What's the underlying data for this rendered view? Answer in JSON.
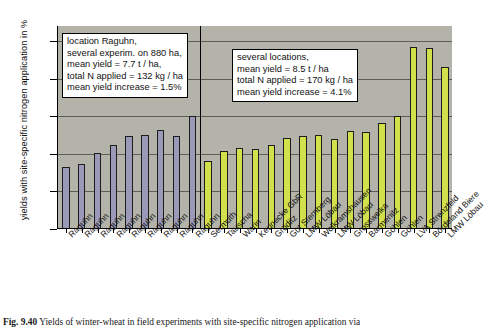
{
  "figure": {
    "caption_prefix": "Fig. 9.40",
    "caption_text": "Yields of winter-wheat in field experiments with site-specific nitrogen application via"
  },
  "annotations": {
    "box_left": [
      "location Raguhn,",
      "several experim. on 880 ha,",
      "mean yield = 7.7 t / ha,",
      "total N applied = 132 kg / ha",
      "mean yield increase = 1.5%"
    ],
    "box_right": [
      "several locations,",
      "mean yield = 8.5 t / ha",
      "total N applied = 170 kg / ha",
      "mean yield increase = 4.1%"
    ]
  },
  "colors": {
    "plot_background": "#b3b3aa",
    "series_raguhn": "#9a9ab8",
    "series_locations": "#d2e04b",
    "gridline": "#5e5e58",
    "axis": "#000000"
  },
  "chart_data": {
    "type": "bar",
    "title": "",
    "xlabel": "",
    "ylabel": "yields with site-specific nitrogen application in %",
    "ylim": [
      90,
      117
    ],
    "yticks": [
      90,
      95,
      100,
      105,
      110,
      115
    ],
    "grid": true,
    "legend": "none",
    "categories": [
      "Raguhn",
      "Raguhn",
      "Raguhn",
      "Raguhn",
      "Raguhn",
      "Raguhn",
      "Raguhn",
      "Raguhn",
      "Raguhn",
      "Sermuth",
      "Tauscha",
      "Warin",
      "Keunecke GbR",
      "Gröditz",
      "Gut Sternberg",
      "LMW Löbau",
      "Wolkramshausen",
      "LMW Löbau",
      "Grosswelka",
      "Barmenitz",
      "Göhlen",
      "Göhlen",
      "LVA Strenzfeld",
      "Bördeland Biere",
      "LMW Löbau"
    ],
    "values": [
      98.2,
      98.7,
      100.1,
      101.2,
      102.4,
      102.5,
      103.2,
      102.4,
      105.0,
      99.0,
      100.4,
      100.8,
      100.7,
      101.2,
      102.1,
      102.4,
      102.5,
      102.0,
      103.1,
      102.9,
      104.1,
      105.0,
      114.2,
      114.1,
      111.6
    ],
    "group_of_bar": [
      "raguhn",
      "raguhn",
      "raguhn",
      "raguhn",
      "raguhn",
      "raguhn",
      "raguhn",
      "raguhn",
      "raguhn",
      "locations",
      "locations",
      "locations",
      "locations",
      "locations",
      "locations",
      "locations",
      "locations",
      "locations",
      "locations",
      "locations",
      "locations",
      "locations",
      "locations",
      "locations",
      "locations"
    ],
    "series": [
      {
        "name": "location Raguhn",
        "color": "#9a9ab8",
        "count": 9
      },
      {
        "name": "several locations",
        "color": "#d2e04b",
        "count": 16
      }
    ]
  }
}
